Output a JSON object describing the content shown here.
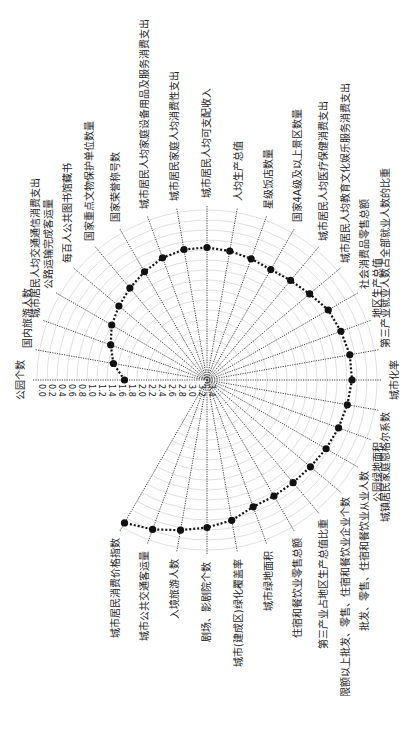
{
  "chart_data": {
    "type": "radar",
    "orientation_note": "polar chart rotated 90 degrees clockwise on the page; radial axis reversed (0.0 at outer ring, increasing toward center)",
    "title": "",
    "radial_ticks": [
      "0.0",
      "0.2",
      "0.4",
      "0.6",
      "0.8",
      "1.0",
      "1.2",
      "1.4",
      "1.6",
      "1.8",
      "2.0",
      "2.2",
      "2.4",
      "2.6",
      "2.8",
      "3.0",
      "3.2",
      "3.4"
    ],
    "rlim": [
      0.0,
      3.4
    ],
    "grid": true,
    "categories": [
      "公园个数",
      "国内旅游人数",
      "城市居民人均交通通信消费支出",
      "公路运输完成客运量",
      "每百人公共图书馆藏书",
      "国家重点文物保护单位数量",
      "国家荣誉称号数",
      "城市居民人均家庭设备用品及服务消费支出",
      "城市居民家庭人均消费性支出",
      "城市居民人均可支配收入",
      "人均生产总值",
      "星级饭店数量",
      "国家4A级及以上景区数量",
      "城市居民人均医疗保健消费支出",
      "城市居民人均教育文化娱乐服务消费支出",
      "社会消费品零售总额",
      "地区生产总值",
      "第三产业就业人数占全部就业人数的比重",
      "城市化率",
      "城镇居民家庭恩格尔系数",
      "公园绿地面积",
      "批发、零售、住宿和餐饮业从业人数",
      "限额以上批发、零售、住宿和餐饮业企业个数",
      "第三产业占地区生产总值比重",
      "住宿和餐饮业零售总额",
      "城市绿地面积",
      "城市(建成区)绿化覆盖率",
      "剧场、影剧院个数",
      "入境旅游人数",
      "城市公共交通客运量",
      "城市居民消费价格指数"
    ],
    "series": [
      {
        "name": "指标值",
        "values": [
          1.75,
          1.5,
          1.35,
          1.2,
          1.1,
          1.0,
          0.9,
          0.8,
          0.75,
          0.75,
          0.78,
          0.82,
          0.85,
          0.8,
          0.72,
          0.6,
          0.55,
          0.5,
          0.5,
          0.55,
          0.6,
          0.65,
          0.7,
          0.72,
          0.72,
          0.7,
          0.55,
          0.45,
          0.35,
          0.22,
          0.1
        ]
      }
    ],
    "marker": "filled-circle",
    "line_style": "dotted",
    "color": "#111111"
  }
}
